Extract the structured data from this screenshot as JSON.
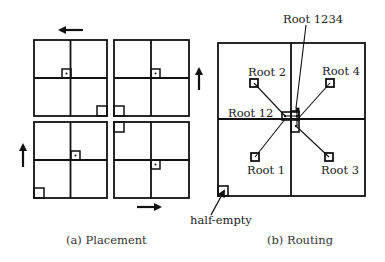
{
  "panel_a": {
    "caption": "(a) Placement",
    "arrows": [
      "left",
      "up",
      "right",
      "up"
    ]
  },
  "panel_b": {
    "caption": "(b) Routing",
    "labels": {
      "root_1234": "Root 1234",
      "root_2": "Root 2",
      "root_4": "Root 4",
      "root_12": "Root 12",
      "root_1": "Root 1",
      "root_3": "Root 3",
      "half_empty": "half-empty"
    }
  },
  "colors": {
    "stroke": "#111111",
    "background": "#ffffff",
    "text": "#222222"
  }
}
